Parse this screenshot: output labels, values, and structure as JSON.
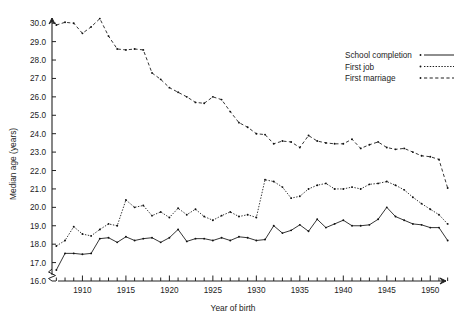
{
  "chart_data": {
    "type": "line",
    "title": "",
    "xlabel": "Year of birth",
    "ylabel": "Median age (years)",
    "xlim": [
      1906.5,
      1952.5
    ],
    "ylim": [
      16.0,
      30.5
    ],
    "grid": false,
    "legend_position": "top-right",
    "ytick_labels": [
      "16.0",
      "17.0",
      "18.0",
      "19.0",
      "20.0",
      "21.0",
      "22.0",
      "23.0",
      "24.0",
      "25.0",
      "26.0",
      "27.0",
      "28.0",
      "29.0",
      "30.0"
    ],
    "ytick_values": [
      16,
      17,
      18,
      19,
      20,
      21,
      22,
      23,
      24,
      25,
      26,
      27,
      28,
      29,
      30
    ],
    "xtick_labels": [
      "1910",
      "1915",
      "1920",
      "1925",
      "1930",
      "1935",
      "1940",
      "1945",
      "1950"
    ],
    "xtick_values": [
      1910,
      1915,
      1920,
      1925,
      1930,
      1935,
      1940,
      1945,
      1950
    ],
    "axis_break": true,
    "x": [
      1907,
      1908,
      1909,
      1910,
      1911,
      1912,
      1913,
      1914,
      1915,
      1916,
      1917,
      1918,
      1919,
      1920,
      1921,
      1922,
      1923,
      1924,
      1925,
      1926,
      1927,
      1928,
      1929,
      1930,
      1931,
      1932,
      1933,
      1934,
      1935,
      1936,
      1937,
      1938,
      1939,
      1940,
      1941,
      1942,
      1943,
      1944,
      1945,
      1946,
      1947,
      1948,
      1949,
      1950,
      1951,
      1952
    ],
    "series": [
      {
        "name": "School completion",
        "style": "solid",
        "values": [
          16.6,
          17.5,
          17.5,
          17.45,
          17.5,
          18.3,
          18.35,
          18.1,
          18.4,
          18.2,
          18.3,
          18.35,
          18.1,
          18.35,
          18.8,
          18.15,
          18.3,
          18.3,
          18.2,
          18.35,
          18.2,
          18.4,
          18.35,
          18.2,
          18.25,
          19.0,
          18.6,
          18.75,
          19.05,
          18.7,
          19.35,
          18.9,
          19.1,
          19.3,
          19.0,
          19.0,
          19.05,
          19.35,
          20.0,
          19.5,
          19.3,
          19.1,
          19.05,
          18.9,
          18.9,
          18.2
        ]
      },
      {
        "name": "First job",
        "style": "dotted",
        "values": [
          17.9,
          18.2,
          18.95,
          18.55,
          18.45,
          18.8,
          19.1,
          19.0,
          20.4,
          20.0,
          20.1,
          19.55,
          19.75,
          19.45,
          19.95,
          19.6,
          19.9,
          19.5,
          19.3,
          19.55,
          19.75,
          19.5,
          19.6,
          19.45,
          21.5,
          21.4,
          21.1,
          20.5,
          20.6,
          21.0,
          21.2,
          21.3,
          21.0,
          21.0,
          21.1,
          21.0,
          21.25,
          21.3,
          21.4,
          21.2,
          20.95,
          20.55,
          20.2,
          19.9,
          19.6,
          19.1
        ]
      },
      {
        "name": "First marriage",
        "style": "dashed",
        "values": [
          29.9,
          30.05,
          30.0,
          29.45,
          29.8,
          30.25,
          29.3,
          28.6,
          28.55,
          28.6,
          28.55,
          27.3,
          26.95,
          26.5,
          26.25,
          26.0,
          25.7,
          25.65,
          26.0,
          25.85,
          25.2,
          24.6,
          24.35,
          24.0,
          23.95,
          23.45,
          23.6,
          23.55,
          23.25,
          23.9,
          23.6,
          23.5,
          23.45,
          23.45,
          23.7,
          23.2,
          23.4,
          23.55,
          23.25,
          23.15,
          23.2,
          23.0,
          22.8,
          22.75,
          22.6,
          21.05
        ]
      }
    ]
  },
  "legend": {
    "items": [
      {
        "label": "School completion"
      },
      {
        "label": "First job"
      },
      {
        "label": "First marriage"
      }
    ]
  },
  "axes": {
    "y_title": "Median age (years)",
    "x_title": "Year of birth"
  }
}
